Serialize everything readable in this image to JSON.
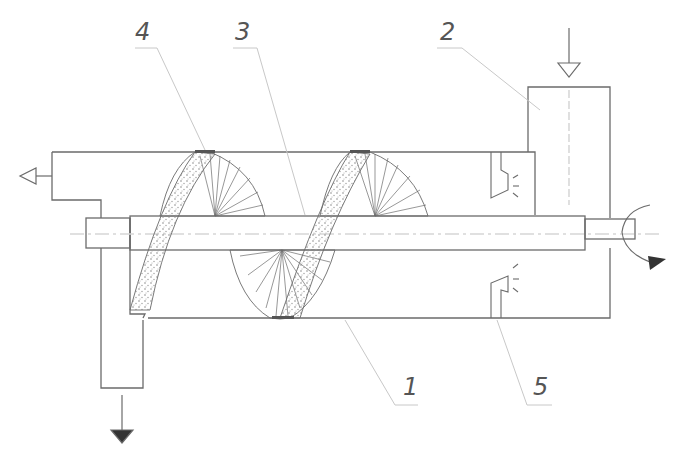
{
  "diagram": {
    "type": "screw conveyor / dryer schematic",
    "callouts": [
      {
        "id": "1",
        "label": "1",
        "target": "helical-screw-flight-lower"
      },
      {
        "id": "2",
        "label": "2",
        "target": "feed-hopper"
      },
      {
        "id": "3",
        "label": "3",
        "target": "central-shaft"
      },
      {
        "id": "4",
        "label": "4",
        "target": "helical-screw-flight-upper"
      },
      {
        "id": "5",
        "label": "5",
        "target": "emitter-device"
      }
    ],
    "flows": {
      "inlet": "feed-inlet-arrow-top",
      "exhaust": "gas-outlet-arrow-left",
      "discharge": "product-discharge-arrow-bottom",
      "rotation": "shaft-rotation-arrow"
    },
    "colors": {
      "line": "#6b6b6b",
      "leader": "#c8c8c8",
      "fill_dark": "#333333",
      "stipple": "#8a8a8a"
    }
  }
}
